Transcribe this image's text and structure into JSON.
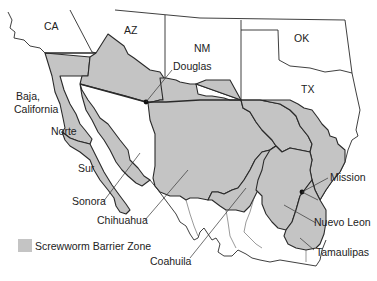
{
  "map": {
    "colors": {
      "barrier_zone": "#c4c4c4",
      "outline": "#2a2a2a",
      "background": "#ffffff"
    },
    "us_states": [
      {
        "id": "ca",
        "label": "CA"
      },
      {
        "id": "az",
        "label": "AZ"
      },
      {
        "id": "nm",
        "label": "NM"
      },
      {
        "id": "ok",
        "label": "OK"
      },
      {
        "id": "tx",
        "label": "TX"
      }
    ],
    "mexican_states": [
      {
        "id": "baja-california",
        "label_line1": "Baja,",
        "label_line2": "California"
      },
      {
        "id": "norte",
        "label": "Norte"
      },
      {
        "id": "sur",
        "label": "Sur"
      },
      {
        "id": "sonora",
        "label": "Sonora"
      },
      {
        "id": "chihuahua",
        "label": "Chihuahua"
      },
      {
        "id": "coahuila",
        "label": "Coahuila"
      },
      {
        "id": "nuevo-leon",
        "label": "Nuevo Leon"
      },
      {
        "id": "tamaulipas",
        "label": "Tamaulipas"
      }
    ],
    "cities": [
      {
        "id": "douglas",
        "label": "Douglas"
      },
      {
        "id": "mission",
        "label": "Mission"
      }
    ],
    "legend": {
      "label": "Screwworm Barrier Zone"
    }
  }
}
